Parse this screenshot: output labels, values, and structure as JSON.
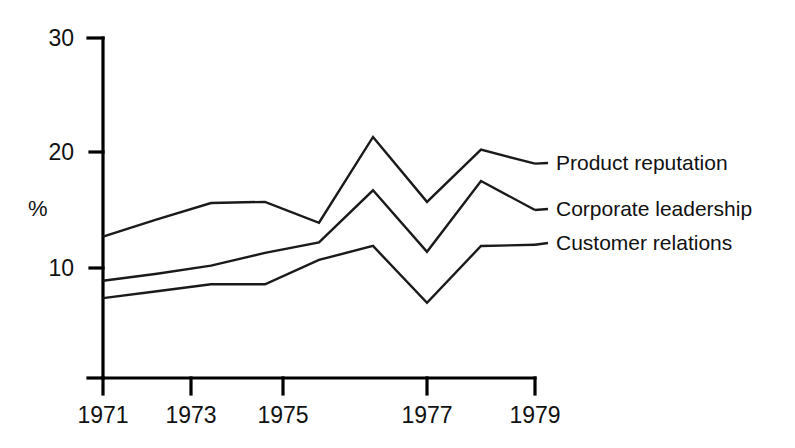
{
  "chart_data": {
    "type": "line",
    "title": "",
    "subtitle": "",
    "xlabel": "",
    "ylabel": "%",
    "x": [
      1971,
      1972,
      1973,
      1974,
      1975,
      1976,
      1977,
      1978,
      1979
    ],
    "xlim": [
      1971,
      1979
    ],
    "ylim": [
      0,
      30
    ],
    "y_ticks": [
      10,
      20,
      30
    ],
    "y_tick_labels": [
      "10",
      "20",
      "30"
    ],
    "x_ticks": [
      1971,
      1973,
      1975,
      1977,
      1979
    ],
    "x_tick_labels": [
      "1971",
      "1973",
      "1975",
      "1977",
      "1979"
    ],
    "grid": false,
    "legend_position": "right-of-lines-inline",
    "line_color": "#1a1a1a",
    "axis_color": "#000000",
    "series": [
      {
        "name": "Product reputation",
        "values": [
          12.7,
          14.2,
          15.6,
          15.7,
          13.9,
          21.3,
          15.7,
          20.2,
          19.0
        ]
      },
      {
        "name": "Corporate leadership",
        "values": [
          8.9,
          9.5,
          10.2,
          11.3,
          12.2,
          16.7,
          11.4,
          17.5,
          15.0
        ]
      },
      {
        "name": "Customer relations",
        "values": [
          7.4,
          8.0,
          8.6,
          8.6,
          10.7,
          11.9,
          7.0,
          11.9,
          12.0
        ]
      }
    ]
  },
  "axis": {
    "y_label": "%",
    "y_ticks": [
      {
        "label": "30",
        "value": 30
      },
      {
        "label": "20",
        "value": 20
      },
      {
        "label": "10",
        "value": 10
      }
    ],
    "x_ticks": [
      {
        "label": "1971",
        "value": 1971
      },
      {
        "label": "1973",
        "value": 1973
      },
      {
        "label": "1975",
        "value": 1975
      },
      {
        "label": "1977",
        "value": 1977
      },
      {
        "label": "1979",
        "value": 1979
      }
    ]
  },
  "legend": {
    "items": [
      {
        "label": "Product reputation"
      },
      {
        "label": "Corporate leadership"
      },
      {
        "label": "Customer relations"
      }
    ]
  }
}
